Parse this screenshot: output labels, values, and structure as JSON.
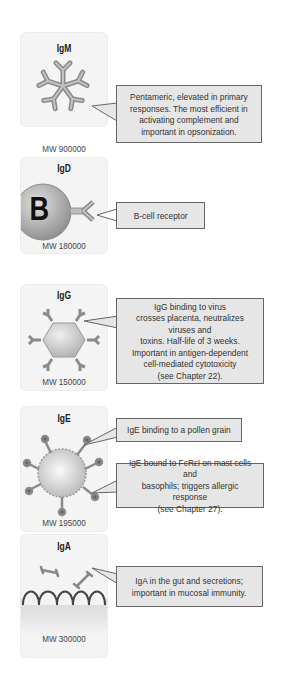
{
  "panels": [
    {
      "title": "IgM",
      "mw": "MW 900000",
      "callouts": [
        "Pentameric, elevated in primary\nresponses. The most efficient in\nactivating complement and\nimportant in opsonization."
      ]
    },
    {
      "title": "IgD",
      "mw": "MW 180000",
      "cell_label": "B",
      "callouts": [
        "B-cell receptor"
      ]
    },
    {
      "title": "IgG",
      "mw": "MW 150000",
      "callouts": [
        "IgG binding to virus\ncrosses placenta, neutralizes viruses and\ntoxins. Half-life of 3 weeks.\nImportant in antigen-dependent\ncell-mediated cytotoxicity\n(see Chapter 22)."
      ]
    },
    {
      "title": "IgE",
      "mw": "MW 195000",
      "callouts": [
        "IgE binding to a pollen grain",
        "IgE bound to FcRεI on mast cells and\nbasophils; triggers allergic response\n(see Chapter 27)."
      ]
    },
    {
      "title": "IgA",
      "mw": "MW 300000",
      "callouts": [
        "IgA in the gut and secretions;\nimportant in mucosal immunity."
      ]
    }
  ],
  "colors": {
    "panel_bg": "#f4f4f4",
    "callout_bg": "#e6e6e6",
    "antibody": "#9a9a9a",
    "border": "#666666"
  }
}
